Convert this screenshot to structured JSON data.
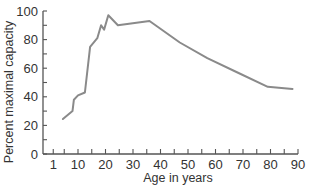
{
  "chart_data": {
    "type": "line",
    "title": "",
    "xlabel": "Age in years",
    "ylabel": "Percent maximal capacity",
    "xlim": [
      0,
      90
    ],
    "ylim": [
      0,
      100
    ],
    "x_ticks_labeled": [
      1,
      10,
      20,
      30,
      40,
      50,
      60,
      70,
      80,
      90
    ],
    "x_tick_labels": [
      "1",
      "10",
      "20",
      "30",
      "40",
      "50",
      "60",
      "70",
      "80",
      "90"
    ],
    "y_ticks_labeled": [
      0,
      20,
      40,
      60,
      80,
      100
    ],
    "y_tick_labels": [
      "0",
      "20",
      "40",
      "60",
      "80",
      "100"
    ],
    "grid": false,
    "legend": null,
    "series": [
      {
        "name": "Maximal capacity",
        "color": "#8a8a8a",
        "x": [
          4.5,
          8,
          8.5,
          10,
          12.5,
          14.4,
          17,
          18.4,
          19.5,
          21,
          24.5,
          36,
          47,
          57,
          68,
          79,
          88
        ],
        "values": [
          24.5,
          30,
          38,
          41,
          43,
          75,
          81,
          90,
          87,
          97,
          90,
          93,
          78,
          67,
          57,
          47,
          45.5
        ]
      }
    ]
  }
}
